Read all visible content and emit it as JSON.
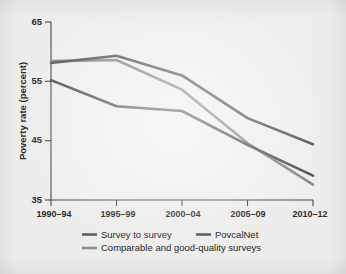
{
  "figure": {
    "background_color": "#ededec",
    "panel_color": "#efefee",
    "axis_color": "#4a4a4a"
  },
  "chart_data": {
    "type": "line",
    "title": "",
    "subtitle": "",
    "xlabel": "",
    "ylabel": "Poverty rate (percent)",
    "categories": [
      "1990–94",
      "1995–99",
      "2000–04",
      "2005–09",
      "2010–12"
    ],
    "xtick_labels": [
      "1990–94",
      "1995–99",
      "2000–04",
      "2005–09",
      "2010–12"
    ],
    "ytick_labels": [
      "35",
      "45",
      "55",
      "65"
    ],
    "yticks": [
      35,
      45,
      55,
      65
    ],
    "ylim": [
      35,
      65
    ],
    "xlim": [
      0,
      4
    ],
    "grid": false,
    "legend_position": "bottom",
    "series": [
      {
        "name": "Survey to survey",
        "color": "#5f5f5f",
        "linewidth": 2.6,
        "values": [
          58.1,
          59.3,
          56.0,
          48.8,
          44.4
        ]
      },
      {
        "name": "PovcalNet",
        "color": "#565656",
        "linewidth": 2.6,
        "values": [
          55.2,
          50.8,
          50.0,
          44.3,
          39.1
        ]
      },
      {
        "name": "Comparable and good-quality surveys",
        "color": "#8c8c8c",
        "linewidth": 2.6,
        "values": [
          58.4,
          58.6,
          53.6,
          44.6,
          37.6
        ]
      }
    ]
  },
  "legend": {
    "entries": [
      {
        "label": "Survey to survey",
        "color": "#5f5f5f"
      },
      {
        "label": "PovcalNet",
        "color": "#565656"
      },
      {
        "label": "Comparable and good-quality surveys",
        "color": "#8c8c8c"
      }
    ]
  }
}
